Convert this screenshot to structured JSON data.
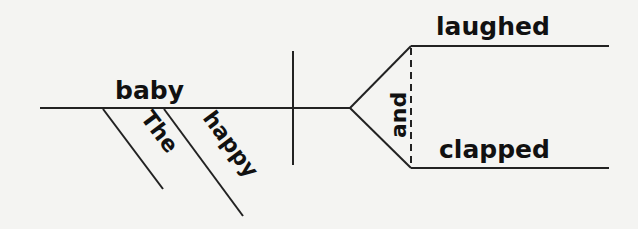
{
  "diagram": {
    "type": "sentence-diagram",
    "subject": "baby",
    "modifiers": [
      "The",
      "happy"
    ],
    "conjunction": "and",
    "predicates": [
      "laughed",
      "clapped"
    ],
    "line_color": "#222222",
    "text_color": "#111111",
    "background": "#f4f4f2"
  }
}
